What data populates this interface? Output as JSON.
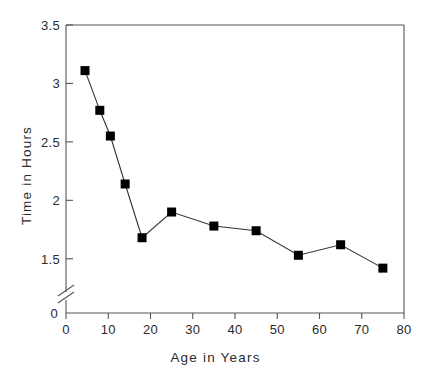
{
  "chart_data": {
    "type": "line",
    "title": "",
    "xlabel": "Age in Years",
    "ylabel": "Time in Hours",
    "xlim": [
      0,
      80
    ],
    "ylim": [
      1.25,
      3.5
    ],
    "y_axis_break": true,
    "y_break_label": "0",
    "grid": false,
    "legend": null,
    "xticks": [
      0,
      10,
      20,
      30,
      40,
      50,
      60,
      70,
      80
    ],
    "xtick_labels": [
      "0",
      "10",
      "20",
      "30",
      "40",
      "50",
      "60",
      "70",
      "80"
    ],
    "yticks": [
      1.5,
      2,
      2.5,
      3,
      3.5
    ],
    "ytick_labels": [
      "1.5",
      "2",
      "2.5",
      "3",
      "3.5"
    ],
    "series": [
      {
        "name": "Time in Hours by Age",
        "marker": "filled-square",
        "marker_color": "#000000",
        "line_color": "#333333",
        "x": [
          4.5,
          8,
          10.5,
          14,
          18,
          25,
          35,
          45,
          55,
          65,
          75
        ],
        "y": [
          3.11,
          2.77,
          2.55,
          2.14,
          1.68,
          1.9,
          1.78,
          1.74,
          1.53,
          1.62,
          1.42
        ]
      }
    ]
  },
  "figure": {
    "background_color": "#ffffff",
    "axis_color": "#555555",
    "text_color": "#2b2b2b"
  }
}
